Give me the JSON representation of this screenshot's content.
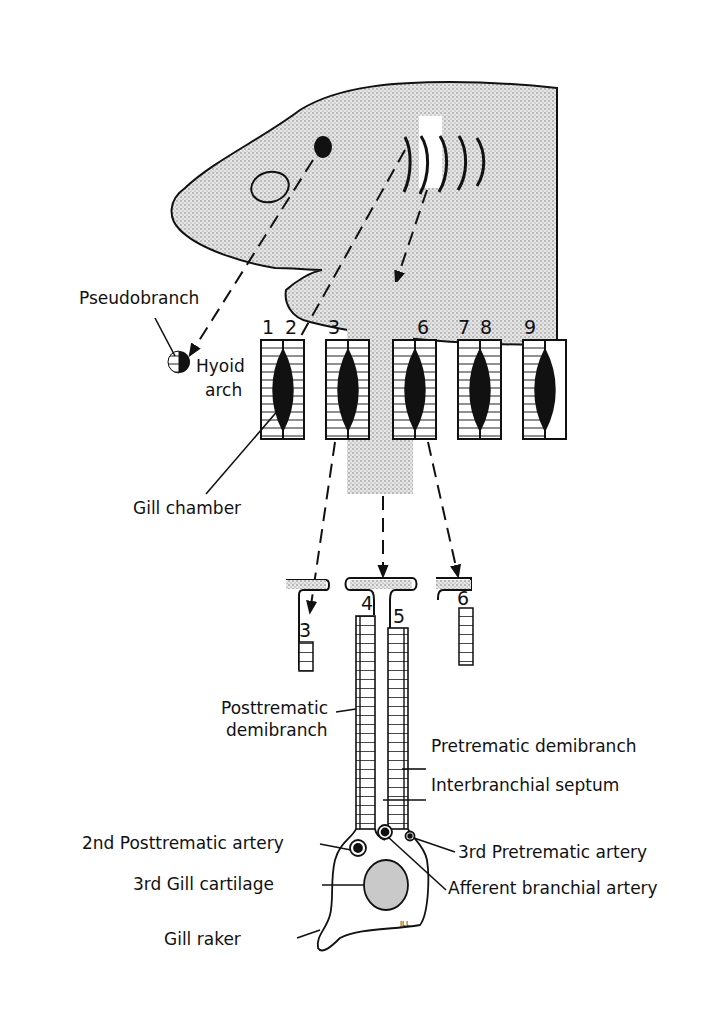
{
  "diagram": {
    "arch_numbers": [
      "1",
      "2",
      "3",
      "6",
      "7",
      "8",
      "9"
    ],
    "section_numbers": [
      "3",
      "4",
      "5",
      "6"
    ],
    "labels": {
      "pseudobranch": "Pseudobranch",
      "hyoid_arch_1": "Hyoid",
      "hyoid_arch_2": "arch",
      "gill_chamber": "Gill chamber",
      "posttrematic_demibranch_1": "Posttrematic",
      "posttrematic_demibranch_2": "demibranch",
      "pretrematic_demibranch": "Pretrematic demibranch",
      "interbranchial_septum": "Interbranchial septum",
      "posttrematic_artery": "2nd Posttrematic artery",
      "pretrematic_artery": "3rd Pretrematic artery",
      "gill_cartilage": "3rd Gill cartilage",
      "afferent_artery": "Afferent branchial artery",
      "gill_raker": "Gill raker",
      "signature": "JLL"
    },
    "colors": {
      "ink": "#111111",
      "stipple": "#c9c9c9",
      "background": "#ffffff"
    }
  }
}
